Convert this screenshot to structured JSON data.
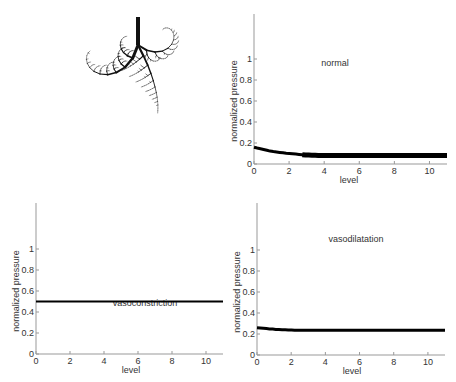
{
  "figure": {
    "tree_panel": {
      "label": "fractal vascular tree",
      "type": "diagram"
    }
  },
  "chart_data": [
    {
      "type": "line",
      "title": "normal",
      "xlabel": "level",
      "ylabel": "normalized pressure",
      "xlim": [
        0,
        11
      ],
      "ylim": [
        0,
        1.2
      ],
      "xticks": [
        "0",
        "2",
        "4",
        "6",
        "8",
        "10"
      ],
      "yticks": [
        "0",
        "0.2",
        "0.4",
        "0.6",
        "0.8",
        "1"
      ],
      "x": [
        0,
        1,
        2,
        3,
        4,
        5,
        6,
        7,
        8,
        9,
        10,
        11
      ],
      "values": [
        0.16,
        0.12,
        0.1,
        0.085,
        0.08,
        0.08,
        0.08,
        0.08,
        0.08,
        0.08,
        0.08,
        0.08
      ],
      "grid": false
    },
    {
      "type": "line",
      "title": "vasoconstriction",
      "xlabel": "level",
      "ylabel": "normalized pressure",
      "xlim": [
        0,
        11
      ],
      "ylim": [
        0,
        1.2
      ],
      "xticks": [
        "0",
        "2",
        "4",
        "6",
        "8",
        "10"
      ],
      "yticks": [
        "0",
        "0.2",
        "0.4",
        "0.6",
        "0.8",
        "1"
      ],
      "x": [
        0,
        1,
        2,
        3,
        4,
        5,
        6,
        7,
        8,
        9,
        10,
        11
      ],
      "values": [
        0.5,
        0.5,
        0.5,
        0.5,
        0.5,
        0.5,
        0.5,
        0.5,
        0.5,
        0.5,
        0.5,
        0.5
      ],
      "grid": false
    },
    {
      "type": "line",
      "title": "vasodilatation",
      "xlabel": "level",
      "ylabel": "normalized pressure",
      "xlim": [
        0,
        11
      ],
      "ylim": [
        0,
        1.2
      ],
      "xticks": [
        "0",
        "2",
        "4",
        "6",
        "8",
        "10"
      ],
      "yticks": [
        "0",
        "0.2",
        "0.4",
        "0.6",
        "0.8",
        "1"
      ],
      "x": [
        0,
        1,
        2,
        3,
        4,
        5,
        6,
        7,
        8,
        9,
        10,
        11
      ],
      "values": [
        0.26,
        0.245,
        0.237,
        0.235,
        0.235,
        0.235,
        0.235,
        0.235,
        0.235,
        0.235,
        0.235,
        0.235
      ],
      "grid": false
    }
  ]
}
